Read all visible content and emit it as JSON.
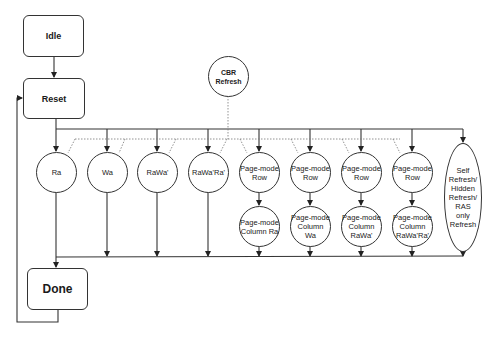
{
  "diagram": {
    "type": "state-diagram",
    "states": {
      "idle": "Idle",
      "reset": "Reset",
      "done": "Done",
      "cbr_refresh": "CBR\nRefresh",
      "ra": "Ra",
      "wa": "Wa",
      "rawa": "RaWa'",
      "rawara": "RaWa'Ra'",
      "pm_row_1": "Page-mode\nRow",
      "pm_row_2": "Page-mode\nRow",
      "pm_row_3": "Page-mode\nRow",
      "pm_row_4": "Page-mode\nRow",
      "pm_col_ra": "Page-mode\nColumn Ra",
      "pm_col_wa": "Page-mode\nColumn\nWa",
      "pm_col_rawa": "Page-mode\nColumn\nRaWa'",
      "pm_col_rawara": "Page-mode\nColumn\nRaWa'Ra'",
      "self_refresh": "Self\nRefresh/\nHidden\nRefresh/\nRAS\nonly\nRefresh"
    },
    "transitions": [
      {
        "from": "Idle",
        "to": "Reset",
        "style": "solid"
      },
      {
        "from": "Reset",
        "to": [
          "Ra",
          "Wa",
          "RaWa'",
          "RaWa'Ra'",
          "Page-mode Row",
          "Self Refresh/Hidden Refresh/RAS only Refresh"
        ],
        "style": "solid"
      },
      {
        "from": "CBR Refresh",
        "to": [
          "Ra",
          "Wa",
          "RaWa'",
          "RaWa'Ra'",
          "Page-mode Row"
        ],
        "style": "dotted"
      },
      {
        "from": "Page-mode Row",
        "to": "Page-mode Column",
        "style": "solid"
      },
      {
        "from": "all operations",
        "to": "Done",
        "style": "solid"
      },
      {
        "from": "Done",
        "to": "Reset",
        "style": "solid"
      }
    ]
  }
}
